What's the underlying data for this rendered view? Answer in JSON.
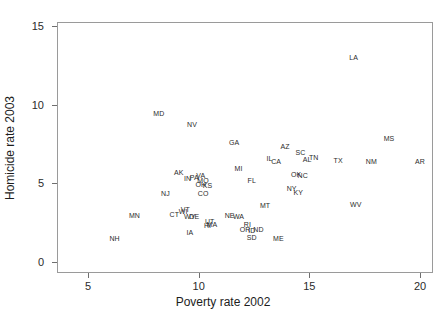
{
  "chart_data": {
    "type": "scatter",
    "title": "",
    "xlabel": "Poverty rate 2002",
    "ylabel": "Homicide rate 2003",
    "xlim": [
      5,
      20
    ],
    "ylim": [
      0,
      15
    ],
    "xticks": [
      5,
      10,
      15,
      20
    ],
    "yticks": [
      0,
      5,
      10,
      15
    ],
    "grid": false,
    "legend": null,
    "marker_style": "text-labels-only",
    "point_label_field": "state",
    "points": [
      {
        "state": "LA",
        "x": 17.0,
        "y": 13.0
      },
      {
        "state": "MD",
        "x": 8.2,
        "y": 9.5
      },
      {
        "state": "NV",
        "x": 9.7,
        "y": 8.8
      },
      {
        "state": "MS",
        "x": 18.6,
        "y": 7.9
      },
      {
        "state": "GA",
        "x": 11.6,
        "y": 7.6
      },
      {
        "state": "AZ",
        "x": 13.9,
        "y": 7.4
      },
      {
        "state": "SC",
        "x": 14.6,
        "y": 7.0
      },
      {
        "state": "TN",
        "x": 15.2,
        "y": 6.7
      },
      {
        "state": "AL",
        "x": 14.9,
        "y": 6.55
      },
      {
        "state": "IL",
        "x": 13.2,
        "y": 6.6
      },
      {
        "state": "CA",
        "x": 13.5,
        "y": 6.4
      },
      {
        "state": "TX",
        "x": 16.3,
        "y": 6.5
      },
      {
        "state": "NM",
        "x": 17.8,
        "y": 6.4
      },
      {
        "state": "AR",
        "x": 20.0,
        "y": 6.4
      },
      {
        "state": "MI",
        "x": 11.8,
        "y": 6.0
      },
      {
        "state": "AK",
        "x": 9.1,
        "y": 5.7
      },
      {
        "state": "VA",
        "x": 10.1,
        "y": 5.55
      },
      {
        "state": "PA",
        "x": 9.8,
        "y": 5.4
      },
      {
        "state": "IN",
        "x": 9.5,
        "y": 5.35
      },
      {
        "state": "MO",
        "x": 10.2,
        "y": 5.2
      },
      {
        "state": "OH",
        "x": 10.1,
        "y": 4.95
      },
      {
        "state": "KS",
        "x": 10.4,
        "y": 4.9
      },
      {
        "state": "FL",
        "x": 12.4,
        "y": 5.2
      },
      {
        "state": "OK",
        "x": 14.4,
        "y": 5.6
      },
      {
        "state": "NC",
        "x": 14.7,
        "y": 5.5
      },
      {
        "state": "NY",
        "x": 14.2,
        "y": 4.7
      },
      {
        "state": "KY",
        "x": 14.5,
        "y": 4.45
      },
      {
        "state": "NJ",
        "x": 8.5,
        "y": 4.4
      },
      {
        "state": "CO",
        "x": 10.2,
        "y": 4.4
      },
      {
        "state": "WV",
        "x": 17.1,
        "y": 3.7
      },
      {
        "state": "MT",
        "x": 13.0,
        "y": 3.6
      },
      {
        "state": "MN",
        "x": 7.1,
        "y": 3.0
      },
      {
        "state": "WI",
        "x": 9.3,
        "y": 3.25
      },
      {
        "state": "CT",
        "x": 8.9,
        "y": 3.05
      },
      {
        "state": "WY",
        "x": 9.6,
        "y": 2.95
      },
      {
        "state": "DE",
        "x": 9.8,
        "y": 2.9
      },
      {
        "state": "NE",
        "x": 11.4,
        "y": 3.0
      },
      {
        "state": "WA",
        "x": 11.8,
        "y": 2.9
      },
      {
        "state": "UT",
        "x": 10.5,
        "y": 2.6
      },
      {
        "state": "MA",
        "x": 10.6,
        "y": 2.4
      },
      {
        "state": "HI",
        "x": 10.4,
        "y": 2.35
      },
      {
        "state": "RI",
        "x": 12.2,
        "y": 2.4
      },
      {
        "state": "OR",
        "x": 12.1,
        "y": 2.1
      },
      {
        "state": "ID",
        "x": 12.4,
        "y": 2.05
      },
      {
        "state": "ND",
        "x": 12.7,
        "y": 2.1
      },
      {
        "state": "SD",
        "x": 12.4,
        "y": 1.6
      },
      {
        "state": "IA",
        "x": 9.6,
        "y": 1.9
      },
      {
        "state": "ME",
        "x": 13.6,
        "y": 1.5
      },
      {
        "state": "NH",
        "x": 6.2,
        "y": 1.5
      },
      {
        "state": "VT",
        "x": 9.4,
        "y": 3.35
      },
      {
        "state": "MN2",
        "x": 7.1,
        "y": 3.0
      }
    ]
  },
  "axes": {
    "x_ticklabels": [
      "5",
      "10",
      "15",
      "20"
    ],
    "y_ticklabels": [
      "0",
      "5",
      "10",
      "15"
    ],
    "x_title": "Poverty rate 2002",
    "y_title": "Homicide rate 2003"
  },
  "style": {
    "frame_color": "#9a9a9a",
    "text_color": "#2b2b2b",
    "background": "#ffffff"
  }
}
